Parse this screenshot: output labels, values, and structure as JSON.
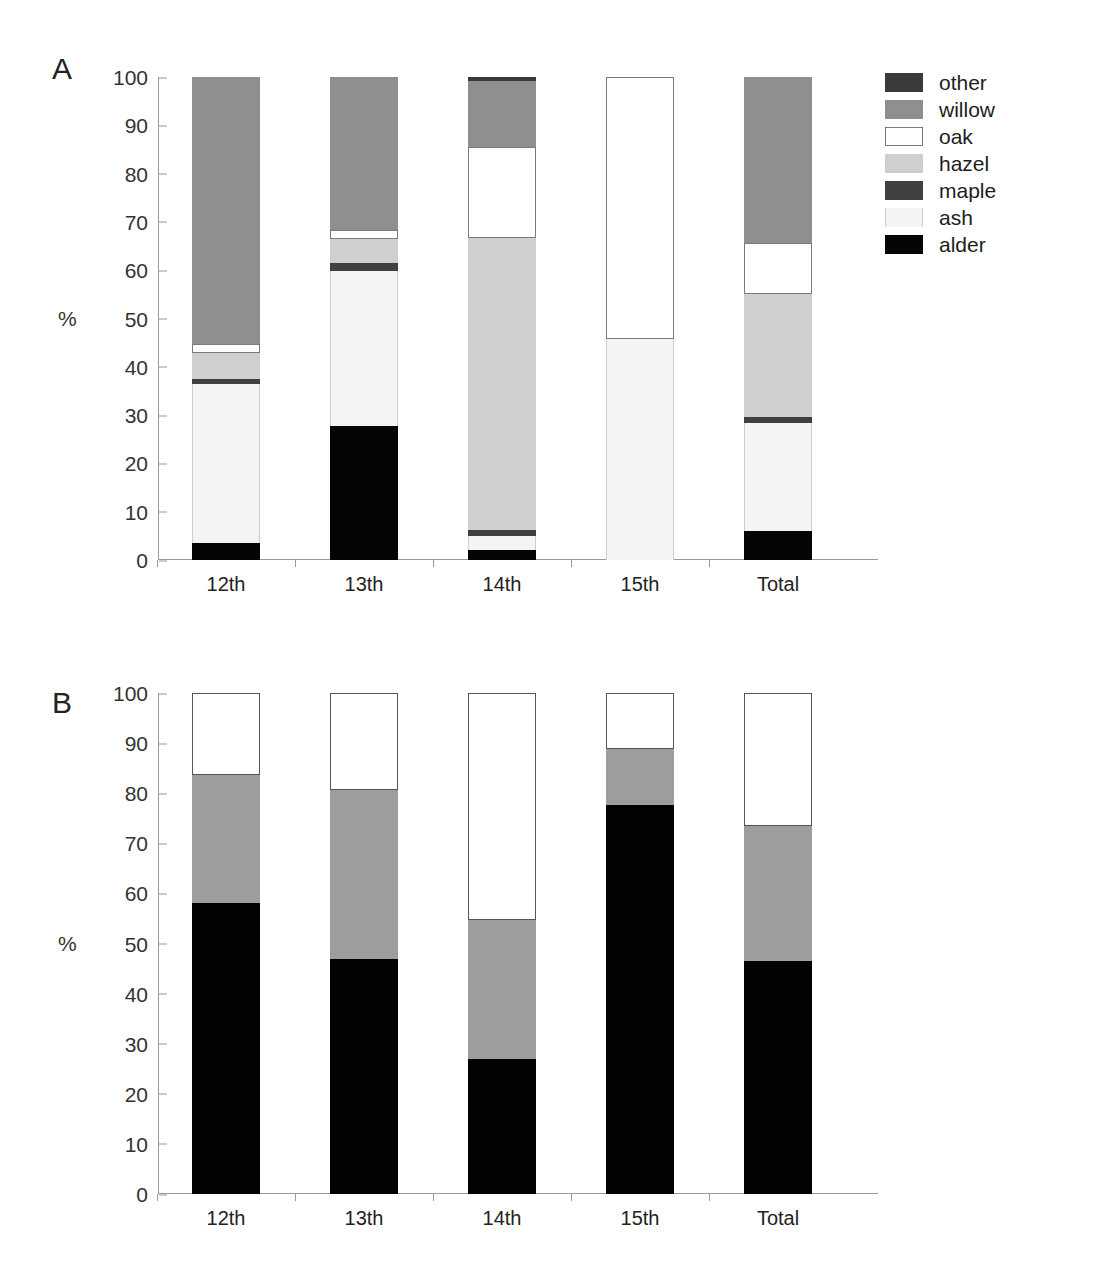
{
  "figure": {
    "panels": [
      {
        "letter": "A",
        "axis": {
          "ylabel": "%",
          "yticks": [
            "0",
            "10",
            "20",
            "30",
            "40",
            "50",
            "60",
            "70",
            "80",
            "90",
            "100"
          ],
          "ymin": 0,
          "ymax": 100
        },
        "categories": [
          "12th",
          "13th",
          "14th",
          "15th",
          "Total"
        ],
        "legend": [
          {
            "label": "other",
            "key": "other",
            "color": "#3a3a3a"
          },
          {
            "label": "willow",
            "key": "willow",
            "color": "#8f8f8f"
          },
          {
            "label": "oak",
            "key": "oak",
            "color": "#ffffff"
          },
          {
            "label": "hazel",
            "key": "hazel",
            "color": "#cfcfcf"
          },
          {
            "label": "maple",
            "key": "maple",
            "color": "#404040"
          },
          {
            "label": "ash",
            "key": "ash",
            "color": "#f4f4f4"
          },
          {
            "label": "alder",
            "key": "alder",
            "color": "#050505"
          }
        ]
      },
      {
        "letter": "B",
        "axis": {
          "ylabel": "%",
          "yticks": [
            "0",
            "10",
            "20",
            "30",
            "40",
            "50",
            "60",
            "70",
            "80",
            "90",
            "100"
          ],
          "ymin": 0,
          "ymax": 100
        },
        "categories": [
          "12th",
          "13th",
          "14th",
          "15th",
          "Total"
        ],
        "legend": [
          {
            "label": "Summer",
            "key": "summer",
            "color": "#ffffff"
          },
          {
            "label": "Spring",
            "key": "spring",
            "color": "#9d9d9d"
          },
          {
            "label": "Autumn/winter",
            "key": "autumn",
            "color": "#020202"
          }
        ]
      }
    ]
  },
  "chart_data": [
    {
      "type": "bar",
      "stacked": true,
      "percent": true,
      "title": "A",
      "xlabel": "",
      "ylabel": "%",
      "ylim": [
        0,
        100
      ],
      "yticks": [
        0,
        10,
        20,
        30,
        40,
        50,
        60,
        70,
        80,
        90,
        100
      ],
      "grid": false,
      "legend_position": "right",
      "categories": [
        "12th",
        "13th",
        "14th",
        "15th",
        "Total"
      ],
      "series": [
        {
          "name": "alder",
          "color": "#050505",
          "values": [
            3.5,
            27.8,
            2.0,
            0.0,
            6.1
          ]
        },
        {
          "name": "ash",
          "color": "#f4f4f4",
          "values": [
            33.0,
            32.0,
            3.0,
            45.7,
            22.3
          ]
        },
        {
          "name": "maple",
          "color": "#404040",
          "values": [
            1.0,
            1.7,
            1.2,
            0.0,
            1.2
          ]
        },
        {
          "name": "hazel",
          "color": "#cfcfcf",
          "values": [
            5.3,
            5.0,
            60.5,
            0.0,
            25.4
          ]
        },
        {
          "name": "oak",
          "color": "#ffffff",
          "values": [
            2.0,
            1.8,
            18.8,
            54.3,
            10.7
          ]
        },
        {
          "name": "willow",
          "color": "#8f8f8f",
          "values": [
            55.2,
            31.7,
            13.7,
            0.0,
            34.3
          ]
        },
        {
          "name": "other",
          "color": "#3a3a3a",
          "values": [
            0.0,
            0.0,
            0.8,
            0.0,
            0.0
          ]
        }
      ],
      "cumulative_tops": {
        "12th": {
          "alder": 3.5,
          "ash": 36.5,
          "maple": 37.5,
          "hazel": 42.8,
          "oak": 44.8,
          "willow": 100.0,
          "other": 100.0
        },
        "13th": {
          "alder": 27.8,
          "ash": 59.8,
          "maple": 61.5,
          "hazel": 66.5,
          "oak": 68.3,
          "willow": 100.0,
          "other": 100.0
        },
        "14th": {
          "alder": 2.0,
          "ash": 5.0,
          "maple": 6.2,
          "hazel": 66.7,
          "oak": 85.5,
          "willow": 99.2,
          "other": 100.0
        },
        "15th": {
          "alder": 0.0,
          "ash": 45.7,
          "maple": 45.7,
          "hazel": 45.7,
          "oak": 100.0,
          "willow": 100.0,
          "other": 100.0
        },
        "Total": {
          "alder": 6.1,
          "ash": 28.4,
          "maple": 29.6,
          "hazel": 55.0,
          "oak": 65.7,
          "willow": 100.0,
          "other": 100.0
        }
      }
    },
    {
      "type": "bar",
      "stacked": true,
      "percent": true,
      "title": "B",
      "xlabel": "",
      "ylabel": "%",
      "ylim": [
        0,
        100
      ],
      "yticks": [
        0,
        10,
        20,
        30,
        40,
        50,
        60,
        70,
        80,
        90,
        100
      ],
      "grid": false,
      "legend_position": "right",
      "categories": [
        "12th",
        "13th",
        "14th",
        "15th",
        "Total"
      ],
      "series": [
        {
          "name": "Autumn/winter",
          "color": "#020202",
          "values": [
            58.0,
            46.9,
            27.0,
            77.6,
            46.6
          ]
        },
        {
          "name": "Spring",
          "color": "#9d9d9d",
          "values": [
            25.7,
            33.8,
            27.6,
            11.2,
            26.9
          ]
        },
        {
          "name": "Summer",
          "color": "#ffffff",
          "values": [
            16.3,
            19.3,
            45.4,
            11.2,
            26.5
          ]
        }
      ],
      "cumulative_tops": {
        "12th": {
          "autumn": 58.0,
          "spring": 83.7,
          "summer": 100.0
        },
        "13th": {
          "autumn": 46.9,
          "spring": 80.7,
          "summer": 100.0
        },
        "14th": {
          "autumn": 27.0,
          "spring": 54.6,
          "summer": 100.0
        },
        "15th": {
          "autumn": 77.6,
          "spring": 88.8,
          "summer": 100.0
        },
        "Total": {
          "autumn": 46.6,
          "spring": 73.5,
          "summer": 100.0
        }
      }
    }
  ]
}
